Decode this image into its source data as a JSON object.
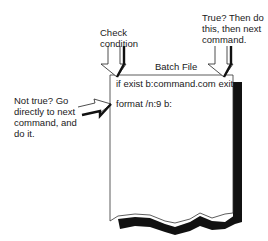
{
  "diagram": {
    "title": "Batch File",
    "lines": [
      "if exist b:command.com exit",
      "format /n:9 b:"
    ],
    "annotations": {
      "check": [
        "Check",
        "condition"
      ],
      "true_branch": [
        "True? Then do",
        "this, then next",
        "command."
      ],
      "false_branch": [
        "Not true? Go",
        "directly to next",
        "command,  and",
        "do it."
      ]
    },
    "icons": {
      "check_arrow": "down-arrow-icon",
      "true_arrow": "down-arrow-icon",
      "false_arrow": "right-arrow-icon"
    },
    "colors": {
      "ink": "#1a1a1a",
      "paper": "#ffffff",
      "shadow": "#111111"
    }
  }
}
